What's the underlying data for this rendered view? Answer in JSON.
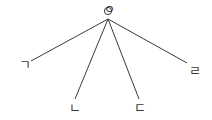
{
  "diagram": {
    "type": "radial-tree",
    "background_color": "#ffffff",
    "stroke_color": "#3a3a3a",
    "stroke_width": 1,
    "width": 212,
    "height": 120,
    "root": {
      "id": "root",
      "label": "ㅇ",
      "x": 108,
      "y": 11
    },
    "hub": {
      "x": 108,
      "y": 19
    },
    "leaves": [
      {
        "id": "leaf-giyeok",
        "label": "ㄱ",
        "x": 19,
        "y": 58,
        "line_end_x": 31,
        "line_end_y": 61
      },
      {
        "id": "leaf-nieun",
        "label": "ㄴ",
        "x": 69,
        "y": 101,
        "line_end_x": 75,
        "line_end_y": 99
      },
      {
        "id": "leaf-digeut",
        "label": "ㄷ",
        "x": 134,
        "y": 101,
        "line_end_x": 139,
        "line_end_y": 99
      },
      {
        "id": "leaf-rieul",
        "label": "ㄹ",
        "x": 189,
        "y": 64,
        "line_end_x": 187,
        "line_end_y": 63
      }
    ]
  }
}
